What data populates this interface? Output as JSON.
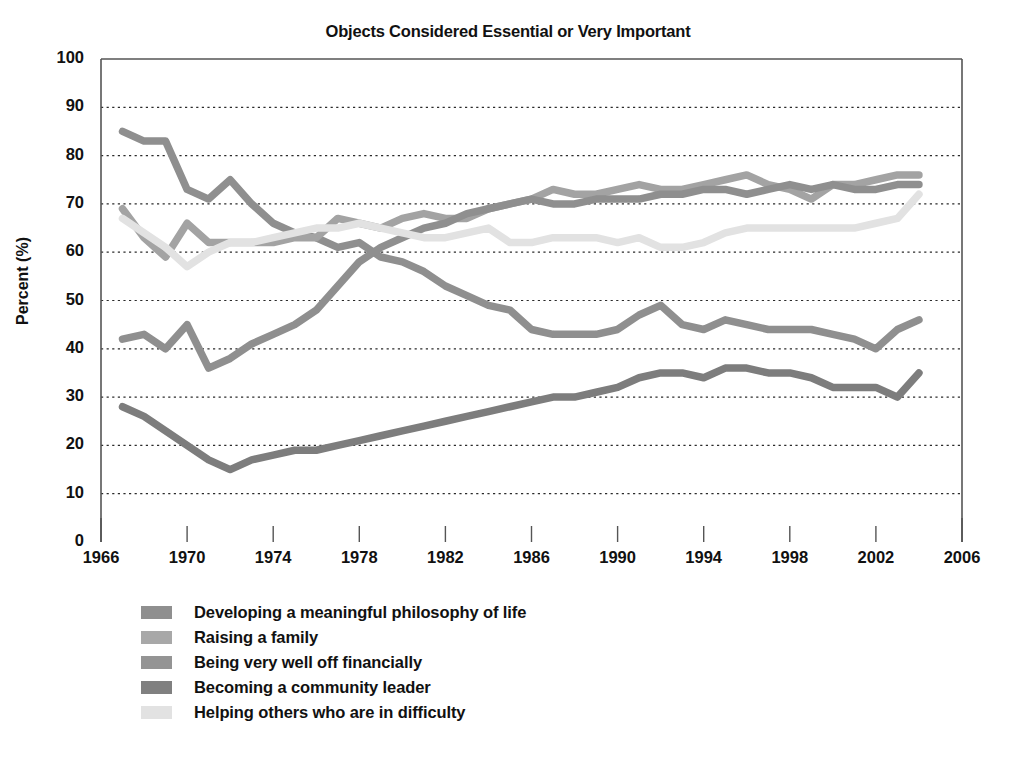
{
  "chart_data": {
    "type": "line",
    "title": "Objects Considered Essential or Very Important",
    "xlabel": "",
    "ylabel": "Percent (%)",
    "xlim": [
      1966,
      2006
    ],
    "ylim": [
      0,
      100
    ],
    "ytick_labels": [
      "0",
      "10",
      "20",
      "30",
      "40",
      "50",
      "60",
      "70",
      "80",
      "90",
      "100"
    ],
    "yticks": [
      0,
      10,
      20,
      30,
      40,
      50,
      60,
      70,
      80,
      90,
      100
    ],
    "xtick_labels": [
      "1966",
      "1970",
      "1974",
      "1978",
      "1982",
      "1986",
      "1990",
      "1994",
      "1998",
      "2002",
      "2006"
    ],
    "xticks": [
      1966,
      1970,
      1974,
      1978,
      1982,
      1986,
      1990,
      1994,
      1998,
      2002,
      2006
    ],
    "grid": "horizontal-dotted",
    "legend_position": "below-left",
    "x": [
      1967,
      1968,
      1969,
      1970,
      1971,
      1972,
      1973,
      1974,
      1975,
      1976,
      1977,
      1978,
      1979,
      1980,
      1981,
      1982,
      1983,
      1984,
      1985,
      1986,
      1987,
      1988,
      1989,
      1990,
      1991,
      1992,
      1993,
      1994,
      1995,
      1996,
      1997,
      1998,
      1999,
      2000,
      2001,
      2002,
      2003,
      2004
    ],
    "series": [
      {
        "name": "Developing a meaningful philosophy of life",
        "color": "#8f8f8f",
        "values": [
          85,
          83,
          83,
          73,
          71,
          75,
          70,
          66,
          64,
          63,
          61,
          62,
          59,
          58,
          56,
          53,
          51,
          49,
          48,
          44,
          43,
          43,
          43,
          44,
          47,
          49,
          45,
          44,
          46,
          45,
          44,
          44,
          44,
          43,
          42,
          40,
          44,
          46
        ]
      },
      {
        "name": "Raising a family",
        "color": "#a3a3a3",
        "values": [
          69,
          63,
          59,
          66,
          62,
          62,
          62,
          62,
          63,
          63,
          67,
          66,
          65,
          67,
          68,
          67,
          67,
          69,
          70,
          71,
          73,
          72,
          72,
          73,
          74,
          73,
          73,
          74,
          75,
          76,
          74,
          73,
          71,
          74,
          74,
          75,
          76,
          76
        ]
      },
      {
        "name": "Being very well off financially",
        "color": "#8f8f8f",
        "values": [
          42,
          43,
          40,
          45,
          36,
          38,
          41,
          43,
          45,
          48,
          53,
          58,
          61,
          63,
          65,
          66,
          68,
          69,
          70,
          71,
          70,
          70,
          71,
          71,
          71,
          72,
          72,
          73,
          73,
          72,
          73,
          74,
          73,
          74,
          73,
          73,
          74,
          74
        ]
      },
      {
        "name": "Becoming a community leader",
        "color": "#7d7d7d",
        "values": [
          28,
          26,
          23,
          20,
          17,
          15,
          17,
          18,
          19,
          19,
          20,
          21,
          22,
          23,
          24,
          25,
          26,
          27,
          28,
          29,
          30,
          30,
          31,
          32,
          34,
          35,
          35,
          34,
          36,
          36,
          35,
          35,
          34,
          32,
          32,
          32,
          30,
          35
        ]
      },
      {
        "name": "Helping others who are in difficulty",
        "color": "#e2e2e2",
        "values": [
          67,
          64,
          61,
          57,
          60,
          62,
          62,
          63,
          64,
          65,
          65,
          66,
          65,
          64,
          63,
          63,
          64,
          65,
          62,
          62,
          63,
          63,
          63,
          62,
          63,
          61,
          61,
          62,
          64,
          65,
          65,
          65,
          65,
          65,
          65,
          66,
          67,
          72
        ]
      }
    ]
  },
  "legend": {
    "items": [
      {
        "label": "Developing a meaningful philosophy of life",
        "color": "#8f8f8f"
      },
      {
        "label": "Raising a family",
        "color": "#a8a8a8"
      },
      {
        "label": "Being very well off financially",
        "color": "#949494"
      },
      {
        "label": "Becoming a community leader",
        "color": "#808080"
      },
      {
        "label": "Helping others who are in difficulty",
        "color": "#e2e2e2"
      }
    ]
  }
}
